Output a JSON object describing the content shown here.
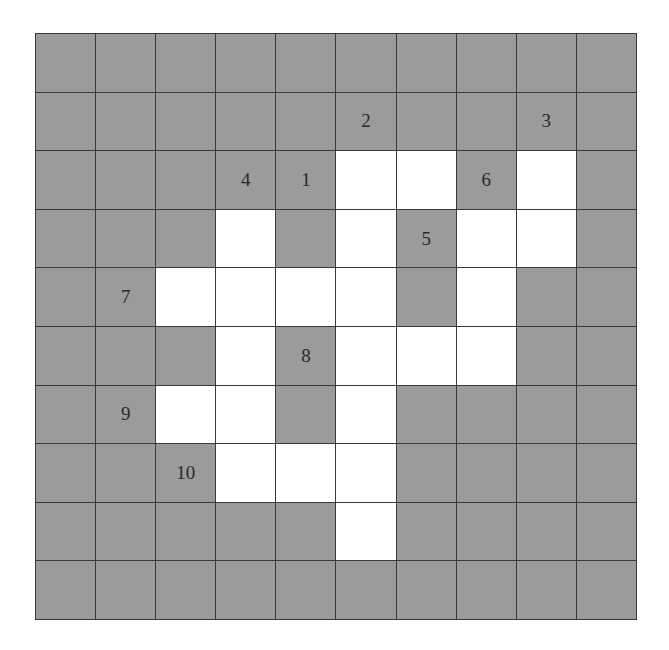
{
  "puzzle": {
    "rows": 10,
    "cols": 10,
    "colors": {
      "blocked": "#9b9b9b",
      "open": "#ffffff",
      "lines": "#3a3a3a",
      "number_text": "#2a2a2a"
    },
    "grid": [
      "..........",
      "..........",
      ".....WW.W.",
      "...W.W.WW.",
      "..WWWW.W..",
      "...W.WWW..",
      "..WW.W....",
      "...WWW....",
      ".....W....",
      ".........."
    ],
    "numbers": [
      {
        "label": "1",
        "row": 2,
        "col": 4
      },
      {
        "label": "2",
        "row": 1,
        "col": 5
      },
      {
        "label": "3",
        "row": 1,
        "col": 8
      },
      {
        "label": "4",
        "row": 2,
        "col": 3
      },
      {
        "label": "5",
        "row": 3,
        "col": 6
      },
      {
        "label": "6",
        "row": 2,
        "col": 7
      },
      {
        "label": "7",
        "row": 4,
        "col": 1
      },
      {
        "label": "8",
        "row": 5,
        "col": 4
      },
      {
        "label": "9",
        "row": 6,
        "col": 1
      },
      {
        "label": "10",
        "row": 7,
        "col": 2
      }
    ]
  }
}
